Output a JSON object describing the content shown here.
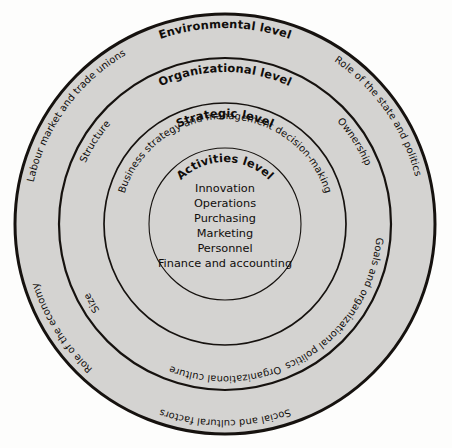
{
  "figure": {
    "shape": "concentric-circles",
    "ring_fill_color": "#d4d3d1",
    "outline_color": "#16120f",
    "background_color": "#fdfdfc",
    "center": {
      "x": 225,
      "y": 224
    }
  },
  "rings": [
    {
      "key": "environmental",
      "title": "Environmental level",
      "radius": 210,
      "labels": [
        "Labour market and trade unions",
        "Role of the state and politics",
        "Technology",
        "Social and cultural factors",
        "Role of the economy"
      ]
    },
    {
      "key": "organizational",
      "title": "Organizational level",
      "radius": 166,
      "labels": [
        "Structure",
        "Ownership",
        "Goals and organizational politics",
        "Organizational culture",
        "Size"
      ]
    },
    {
      "key": "strategic",
      "title": "Strategic level",
      "radius": 121,
      "labels": [
        "Business strategy and management decision-making"
      ]
    },
    {
      "key": "activities",
      "title": "Activities level",
      "radius": 76,
      "labels": []
    }
  ],
  "center_list": {
    "items": [
      "Innovation",
      "Operations",
      "Purchasing",
      "Marketing",
      "Personnel",
      "Finance and accounting"
    ]
  }
}
